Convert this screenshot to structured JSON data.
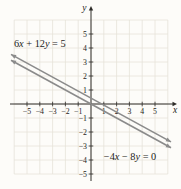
{
  "figure": {
    "background": "#fdfcf9",
    "grid_color": "#e5e2d8",
    "axis_color": "#2e2c29",
    "line_color": "#8b8b8b",
    "text_color": "#1e1c1a"
  },
  "chart_data": {
    "type": "line",
    "title": "",
    "xlabel": "x",
    "ylabel": "y",
    "xlim": [
      -6.5,
      6.5
    ],
    "ylim": [
      -6,
      6.5
    ],
    "grid": true,
    "x_ticks": [
      -5,
      -4,
      -3,
      -2,
      -1,
      1,
      2,
      3,
      4,
      5
    ],
    "y_ticks": [
      5,
      4,
      3,
      2,
      1,
      -1,
      -2,
      -3,
      -4,
      -5
    ],
    "series": [
      {
        "name": "6x + 12y = 5",
        "equation_label": "6x + 12y = 5",
        "slope": -0.5,
        "y_intercept": 0.417,
        "x": [
          -6.25,
          6.25
        ],
        "y": [
          3.542,
          -2.708
        ],
        "label_pos": {
          "x": -4.0,
          "y": 4.3
        }
      },
      {
        "name": "-4x - 8y = 0",
        "equation_label": "−4x − 8y = 0",
        "slope": -0.5,
        "y_intercept": 0,
        "x": [
          -6.25,
          6.25
        ],
        "y": [
          3.125,
          -3.125
        ],
        "label_pos": {
          "x": 3.05,
          "y": -3.72
        }
      }
    ]
  }
}
